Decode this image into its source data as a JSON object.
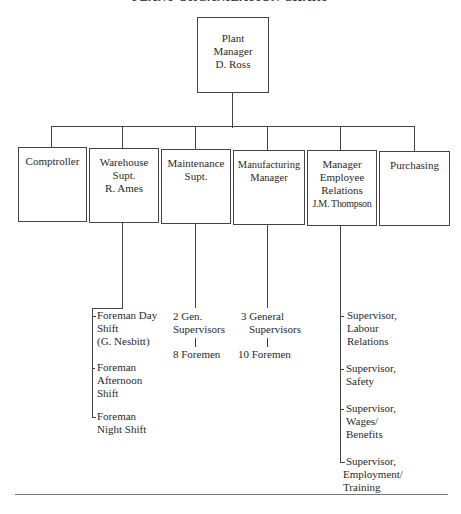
{
  "title": "PLANT ORGANIZATION CHART",
  "top": {
    "lines": [
      "Plant",
      "Manager",
      "D. Ross"
    ]
  },
  "departments": [
    {
      "id": "comptroller",
      "lines": [
        "Comptroller"
      ]
    },
    {
      "id": "warehouse",
      "lines": [
        "Warehouse",
        "Supt.",
        "R. Ames"
      ]
    },
    {
      "id": "maintenance",
      "lines": [
        "Maintenance",
        "Supt."
      ]
    },
    {
      "id": "manufacturing",
      "lines": [
        "Manufacturing",
        "Manager"
      ]
    },
    {
      "id": "employee-relations",
      "lines": [
        "Manager",
        "Employee",
        "Relations",
        "J.M. Thompson"
      ]
    },
    {
      "id": "purchasing",
      "lines": [
        "Purchasing"
      ]
    }
  ],
  "warehouse_reports": [
    {
      "lines": [
        "Foreman Day",
        "Shift",
        "(G. Nesbitt)"
      ]
    },
    {
      "lines": [
        "Foreman",
        "Afternoon",
        "Shift"
      ]
    },
    {
      "lines": [
        "Foreman",
        "Night Shift"
      ]
    }
  ],
  "maintenance_reports": {
    "supervisors": [
      "2 Gen.",
      "Supervisors"
    ],
    "foremen": "8 Foremen"
  },
  "manufacturing_reports": {
    "supervisors": [
      "3 General",
      "Supervisors"
    ],
    "foremen": "10 Foremen"
  },
  "employee_relations_reports": [
    {
      "lines": [
        "Supervisor,",
        "Labour",
        "Relations"
      ]
    },
    {
      "lines": [
        "Supervisor,",
        "Safety"
      ]
    },
    {
      "lines": [
        "Supervisor,",
        "Wages/",
        "Benefits"
      ]
    },
    {
      "lines": [
        "Supervisor,",
        "Employment/",
        "Training"
      ]
    }
  ]
}
